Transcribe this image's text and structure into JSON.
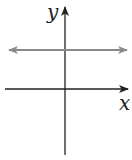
{
  "diagram": {
    "type": "coordinate-plane-graph",
    "axes": {
      "x_label": "x",
      "y_label": "y"
    },
    "line": {
      "kind": "horizontal",
      "equation": "y = c, c > 0",
      "color": "#8a8a8a",
      "arrows": "both ends"
    },
    "axis_color": "#222222"
  }
}
